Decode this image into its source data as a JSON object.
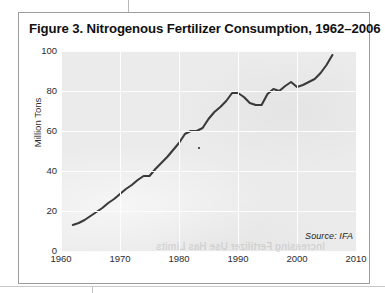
{
  "figure": {
    "title": "Figure 3. Nitrogenous Fertilizer Consumption, 1962–2006",
    "source_note": "Source: IFA",
    "reverse_bleed_text": "Increasing Fertilizer Use Has Limits",
    "border_color": "#9d9d9d",
    "plot_background": "#ebebeb",
    "gridline_color": "#fdfdfd",
    "line_color": "#3a3a3a"
  },
  "chart_data": {
    "type": "line",
    "title": "Figure 3. Nitrogenous Fertilizer Consumption, 1962–2006",
    "xlabel": "",
    "ylabel": "Million Tons",
    "xlim": [
      1960,
      2010
    ],
    "ylim": [
      0,
      100
    ],
    "grid": true,
    "legend": null,
    "xticks": [
      1960,
      1970,
      1980,
      1990,
      2000,
      2010
    ],
    "xtick_labels": [
      "1960",
      "1970",
      "1980",
      "1990",
      "2000",
      "2010"
    ],
    "yticks": [
      0,
      20,
      40,
      60,
      80,
      100
    ],
    "ytick_labels": [
      "0",
      "20",
      "40",
      "60",
      "80",
      "100"
    ],
    "series": [
      {
        "name": "Nitrogenous fertilizer consumption",
        "units": "Million Tons",
        "x": [
          1962,
          1963,
          1964,
          1965,
          1966,
          1967,
          1968,
          1969,
          1970,
          1971,
          1972,
          1973,
          1974,
          1975,
          1976,
          1977,
          1978,
          1979,
          1980,
          1981,
          1982,
          1983,
          1984,
          1985,
          1986,
          1987,
          1988,
          1989,
          1990,
          1991,
          1992,
          1993,
          1994,
          1995,
          1996,
          1997,
          1998,
          1999,
          2000,
          2001,
          2002,
          2003,
          2004,
          2005,
          2006
        ],
        "values": [
          13,
          14,
          15.5,
          17.5,
          19.5,
          21.5,
          24,
          26,
          28.5,
          31,
          33,
          35.5,
          37.5,
          37.5,
          41,
          44,
          47,
          50.5,
          54,
          58.5,
          60,
          60,
          61.5,
          66,
          69.5,
          72,
          75,
          79,
          79,
          77,
          74,
          73,
          73,
          78.5,
          81,
          80,
          82.5,
          84.5,
          82,
          83,
          84.5,
          86,
          89,
          93,
          98
        ]
      }
    ]
  }
}
